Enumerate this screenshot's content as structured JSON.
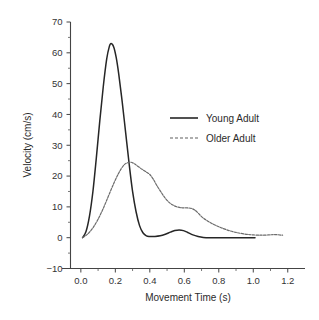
{
  "chart_data": {
    "type": "line",
    "title": "",
    "xlabel": "Movement Time (s)",
    "ylabel": "Velocity (cm/s)",
    "xlim": [
      -0.06,
      1.3
    ],
    "ylim": [
      -10,
      70
    ],
    "xticks": [
      "0.0",
      "0.2",
      "0.4",
      "0.6",
      "0.8",
      "1.0",
      "1.2"
    ],
    "xtick_values": [
      0.0,
      0.2,
      0.4,
      0.6,
      0.8,
      1.0,
      1.2
    ],
    "yticks": [
      "70",
      "60",
      "50",
      "40",
      "30",
      "20",
      "10",
      "0",
      "-10"
    ],
    "ytick_values": [
      70,
      60,
      50,
      40,
      30,
      20,
      10,
      0,
      -10
    ],
    "grid": false,
    "legend_position": "center-right",
    "series": [
      {
        "name": "Young Adult",
        "style": "solid",
        "color": "#262626",
        "x": [
          0.01,
          0.03,
          0.05,
          0.07,
          0.09,
          0.11,
          0.13,
          0.15,
          0.165,
          0.175,
          0.19,
          0.205,
          0.22,
          0.24,
          0.26,
          0.28,
          0.3,
          0.32,
          0.34,
          0.36,
          0.38,
          0.4,
          0.43,
          0.46,
          0.49,
          0.52,
          0.545,
          0.57,
          0.595,
          0.62,
          0.65,
          0.68,
          0.71,
          0.75,
          0.8,
          0.86,
          0.92,
          0.97,
          1.01
        ],
        "y": [
          0.0,
          2.0,
          7.0,
          15.0,
          26.0,
          38.0,
          49.0,
          58.0,
          62.0,
          63.0,
          62.0,
          58.5,
          53.0,
          44.0,
          34.0,
          24.0,
          15.0,
          8.5,
          4.0,
          1.6,
          0.6,
          0.4,
          0.4,
          0.6,
          1.1,
          1.8,
          2.3,
          2.5,
          2.3,
          1.7,
          0.9,
          0.4,
          0.1,
          0.0,
          0.0,
          0.0,
          0.0,
          0.0,
          0.0
        ]
      },
      {
        "name": "Older Adult",
        "style": "dashed",
        "color": "#6b6b6b",
        "x": [
          0.01,
          0.04,
          0.07,
          0.1,
          0.13,
          0.16,
          0.19,
          0.22,
          0.25,
          0.275,
          0.29,
          0.31,
          0.33,
          0.355,
          0.38,
          0.4,
          0.42,
          0.44,
          0.465,
          0.49,
          0.515,
          0.54,
          0.565,
          0.59,
          0.615,
          0.64,
          0.66,
          0.68,
          0.705,
          0.73,
          0.76,
          0.79,
          0.82,
          0.86,
          0.9,
          0.95,
          1.0,
          1.05,
          1.09,
          1.13,
          1.17
        ],
        "y": [
          0.0,
          1.2,
          3.2,
          6.0,
          9.5,
          13.5,
          17.5,
          21.0,
          23.6,
          24.4,
          24.5,
          24.0,
          23.2,
          22.2,
          21.3,
          20.5,
          19.0,
          17.0,
          14.8,
          12.8,
          11.3,
          10.4,
          9.9,
          9.7,
          9.7,
          9.5,
          9.0,
          8.0,
          6.6,
          5.6,
          4.6,
          3.8,
          3.1,
          2.3,
          1.7,
          1.2,
          0.9,
          0.8,
          0.9,
          1.0,
          0.8
        ]
      }
    ]
  },
  "legend": {
    "entries": [
      {
        "label": "Young Adult",
        "style": "solid"
      },
      {
        "label": "Older Adult",
        "style": "dashed"
      }
    ]
  },
  "axes": {
    "x_title": "Movement Time (s)",
    "y_title": "Velocity (cm/s)"
  }
}
